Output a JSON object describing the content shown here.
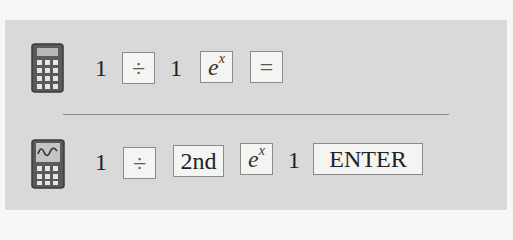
{
  "rows": [
    {
      "id": "scientific-calculator",
      "icon": "scientific-calculator-icon",
      "keystrokes": [
        {
          "type": "text",
          "value": "1"
        },
        {
          "type": "key",
          "label": "÷"
        },
        {
          "type": "text",
          "value": "1"
        },
        {
          "type": "key",
          "label": "e",
          "superscript": "x"
        },
        {
          "type": "key",
          "label": "="
        }
      ]
    },
    {
      "id": "graphing-calculator",
      "icon": "graphing-calculator-icon",
      "keystrokes": [
        {
          "type": "text",
          "value": "1"
        },
        {
          "type": "key",
          "label": "÷"
        },
        {
          "type": "key",
          "label": "2nd"
        },
        {
          "type": "key",
          "label": "e",
          "superscript": "x"
        },
        {
          "type": "text",
          "value": "1"
        },
        {
          "type": "key",
          "label": "ENTER"
        }
      ]
    }
  ],
  "colors": {
    "panel_background": "#d9d9d9",
    "key_background": "#f4f4f2",
    "key_border": "#8a8a8a",
    "icon_body": "#4a4a4a"
  }
}
